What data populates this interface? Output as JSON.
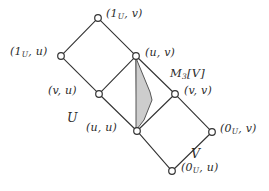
{
  "figure": {
    "type": "hasse-diagram",
    "background_color": "#ffffff",
    "line_color": "#333333",
    "node_fill": "#ffffff",
    "node_stroke": "#333333",
    "shaded_fill": "#cdcdcd",
    "shaded_stroke": "#555555"
  },
  "nodes": [
    {
      "id": "1u_v",
      "x": 98,
      "y": 18,
      "label_head": "(1",
      "label_sub": "U",
      "label_tail": ", v)",
      "label_x": 106,
      "label_y": 8,
      "anchor": "left",
      "name": "node-1u-v"
    },
    {
      "id": "1u_u",
      "x": 61,
      "y": 56,
      "label_head": "(1",
      "label_sub": "U",
      "label_tail": ", u)",
      "label_x": 10,
      "label_y": 46,
      "anchor": "left",
      "name": "node-1u-u"
    },
    {
      "id": "u_v",
      "x": 136,
      "y": 56,
      "label_head": "(u, v)",
      "label_sub": "",
      "label_tail": "",
      "label_x": 145,
      "label_y": 47,
      "anchor": "left",
      "name": "node-u-v"
    },
    {
      "id": "v_u",
      "x": 99,
      "y": 94,
      "label_head": "(v, u)",
      "label_sub": "",
      "label_tail": "",
      "label_x": 48,
      "label_y": 85,
      "anchor": "left",
      "name": "node-v-u"
    },
    {
      "id": "v_v",
      "x": 175,
      "y": 94,
      "label_head": "(v, v)",
      "label_sub": "",
      "label_tail": "",
      "label_x": 184,
      "label_y": 85,
      "anchor": "left",
      "name": "node-v-v"
    },
    {
      "id": "u_u",
      "x": 137,
      "y": 131,
      "label_head": "(u, u)",
      "label_sub": "",
      "label_tail": "",
      "label_x": 86,
      "label_y": 122,
      "anchor": "left",
      "name": "node-u-u"
    },
    {
      "id": "0u_v",
      "x": 212,
      "y": 132,
      "label_head": "(0",
      "label_sub": "U",
      "label_tail": ", v)",
      "label_x": 220,
      "label_y": 123,
      "anchor": "left",
      "name": "node-0u-v"
    },
    {
      "id": "0u_u",
      "x": 172,
      "y": 171,
      "label_head": "(0",
      "label_sub": "U",
      "label_tail": ", u)",
      "label_x": 181,
      "label_y": 162,
      "anchor": "left",
      "name": "node-0u-u"
    }
  ],
  "edges": [
    {
      "from": "1u_v",
      "to": "1u_u",
      "name": "edge-1uv-1uu"
    },
    {
      "from": "1u_v",
      "to": "u_v",
      "name": "edge-1uv-uv"
    },
    {
      "from": "1u_u",
      "to": "v_u",
      "name": "edge-1uu-vu"
    },
    {
      "from": "u_v",
      "to": "v_u",
      "name": "edge-uv-vu"
    },
    {
      "from": "u_v",
      "to": "v_v",
      "name": "edge-uv-vv"
    },
    {
      "from": "u_v",
      "to": "u_u",
      "name": "edge-uv-uu"
    },
    {
      "from": "v_u",
      "to": "u_u",
      "name": "edge-vu-uu"
    },
    {
      "from": "v_v",
      "to": "u_u",
      "name": "edge-vv-uu"
    },
    {
      "from": "v_v",
      "to": "0u_v",
      "name": "edge-vv-0uv"
    },
    {
      "from": "u_u",
      "to": "0u_u",
      "name": "edge-uu-0uu"
    },
    {
      "from": "0u_v",
      "to": "0u_u",
      "name": "edge-0uv-0uu"
    }
  ],
  "shaded_region": {
    "name": "m3-shaded-lens",
    "description": "shaded lens between (u,v) and (u,u) bulging right",
    "path": "M 136 58 L 150 92 L 152 100 L 144 120 L 137 129 L 136 129 Z"
  },
  "annotations": [
    {
      "id": "m3v",
      "text_head": "M",
      "text_sub": "3",
      "text_tail": "[V]",
      "x": 170,
      "y": 68,
      "name": "label-m3-v"
    },
    {
      "id": "set_u",
      "text_head": "U",
      "text_sub": "",
      "text_tail": "",
      "x": 67,
      "y": 112,
      "name": "label-set-u"
    },
    {
      "id": "set_v",
      "text_head": "V",
      "text_sub": "",
      "text_tail": "",
      "x": 191,
      "y": 148,
      "name": "label-set-v"
    }
  ]
}
